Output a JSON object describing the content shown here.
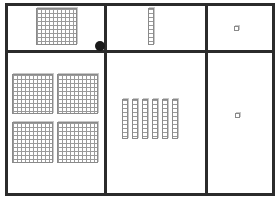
{
  "diagram": {
    "type": "base-ten place value mat",
    "colors": {
      "border": "#2b2b2b",
      "block_line": "#8a8a8a",
      "background": "#ffffff",
      "dot": "#1a1a1a"
    },
    "columns": [
      "hundreds",
      "tens",
      "ones"
    ],
    "rows": [
      {
        "name": "top-row",
        "hundreds": 1,
        "tens": 1,
        "ones": 1
      },
      {
        "name": "bottom-row",
        "hundreds": 4,
        "tens": 6,
        "ones": 1
      }
    ]
  }
}
